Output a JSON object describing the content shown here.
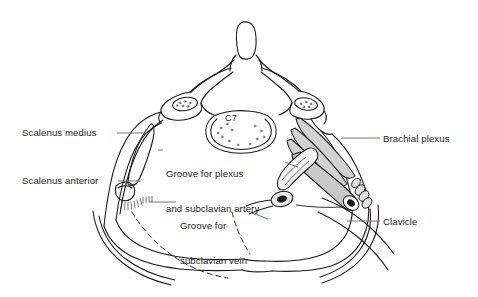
{
  "figure": {
    "type": "anatomical-illustration",
    "view": "superior view of the thoracic inlet / first rib and C7 vertebra",
    "background_color": "#ffffff",
    "line_color": "#1a1a1a",
    "shading_color": "#d2d2d2"
  },
  "labels": {
    "scalenus_medius": "Scalenus medius",
    "scalenus_anterior": "Scalenus anterior",
    "groove_for_plexus_line1": "Groove for plexus",
    "groove_for_plexus_line2": "and subclavian artery",
    "groove_for_vein_line1": "Groove for",
    "groove_for_vein_line2": "subclavian vein",
    "brachial_plexus": "Brachial plexus",
    "clavicle": "Clavicle",
    "vertebra": "C7"
  },
  "structures": [
    {
      "name": "spinous-process",
      "label": ""
    },
    {
      "name": "vertebral-body-c7",
      "label": "C7"
    },
    {
      "name": "transverse-process-left",
      "label": ""
    },
    {
      "name": "transverse-process-right",
      "label": ""
    },
    {
      "name": "first-rib-left",
      "label": ""
    },
    {
      "name": "first-rib-right",
      "label": ""
    },
    {
      "name": "second-rib-left",
      "label": ""
    },
    {
      "name": "second-rib-right",
      "label": ""
    },
    {
      "name": "scalenus-medius-muscle",
      "label": "Scalenus medius"
    },
    {
      "name": "scalenus-anterior-muscle",
      "label": "Scalenus anterior"
    },
    {
      "name": "scalene-tubercle",
      "label": ""
    },
    {
      "name": "brachial-plexus-trunks",
      "label": "Brachial plexus"
    },
    {
      "name": "subclavian-artery-cut-end",
      "label": ""
    },
    {
      "name": "subclavian-vein-cut-end",
      "label": ""
    },
    {
      "name": "clavicle-outline",
      "label": "Clavicle"
    },
    {
      "name": "manubrium-sternum",
      "label": ""
    }
  ]
}
